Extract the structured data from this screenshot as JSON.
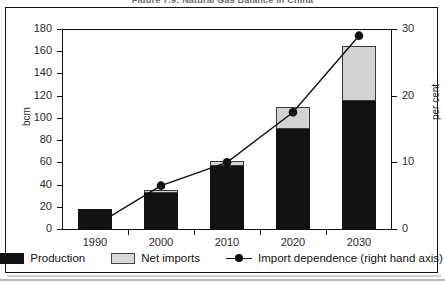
{
  "figure": {
    "title": "Figure 7.9: Natural Gas Balance in China"
  },
  "axes": {
    "left": {
      "label": "bcm",
      "min": 0,
      "max": 180,
      "step": 20,
      "ticks": [
        "0",
        "20",
        "40",
        "60",
        "80",
        "100",
        "120",
        "140",
        "160",
        "180"
      ]
    },
    "right": {
      "label": "per cent",
      "min": 0,
      "max": 30,
      "step": 10,
      "ticks": [
        "0",
        "10",
        "20",
        "30"
      ]
    },
    "x": {
      "ticks": [
        "1990",
        "2000",
        "2010",
        "2020",
        "2030"
      ]
    }
  },
  "legend": {
    "items": [
      {
        "label": "Production",
        "swatch": "filled-black-square",
        "color": "#111111"
      },
      {
        "label": "Net imports",
        "swatch": "filled-grey-square",
        "color": "#d3d3d3"
      },
      {
        "label": "Import dependence (right hand axis)",
        "swatch": "line-with-round-marker",
        "color": "#111111"
      }
    ]
  },
  "chart_data": {
    "type": "bar",
    "title": "Figure 7.9: Natural Gas Balance in China",
    "xlabel": "",
    "ylabel": "bcm",
    "y2label": "per cent",
    "categories": [
      "1990",
      "2000",
      "2010",
      "2020",
      "2030"
    ],
    "stacked": true,
    "ylim": [
      0,
      180
    ],
    "y2lim": [
      0,
      30
    ],
    "grid": false,
    "legend_position": "bottom",
    "series": [
      {
        "name": "Production",
        "type": "bar",
        "axis": "left",
        "color": "#111111",
        "values": [
          18,
          32,
          57,
          90,
          115
        ]
      },
      {
        "name": "Net imports",
        "type": "bar",
        "axis": "left",
        "color": "#d3d3d3",
        "values": [
          0,
          3,
          4,
          20,
          50
        ]
      },
      {
        "name": "Import dependence (right hand axis)",
        "type": "line",
        "axis": "right",
        "color": "#111111",
        "values": [
          0.5,
          6.5,
          10.0,
          17.5,
          29.0
        ]
      }
    ],
    "totals": [
      18,
      35,
      61,
      110,
      165
    ]
  }
}
